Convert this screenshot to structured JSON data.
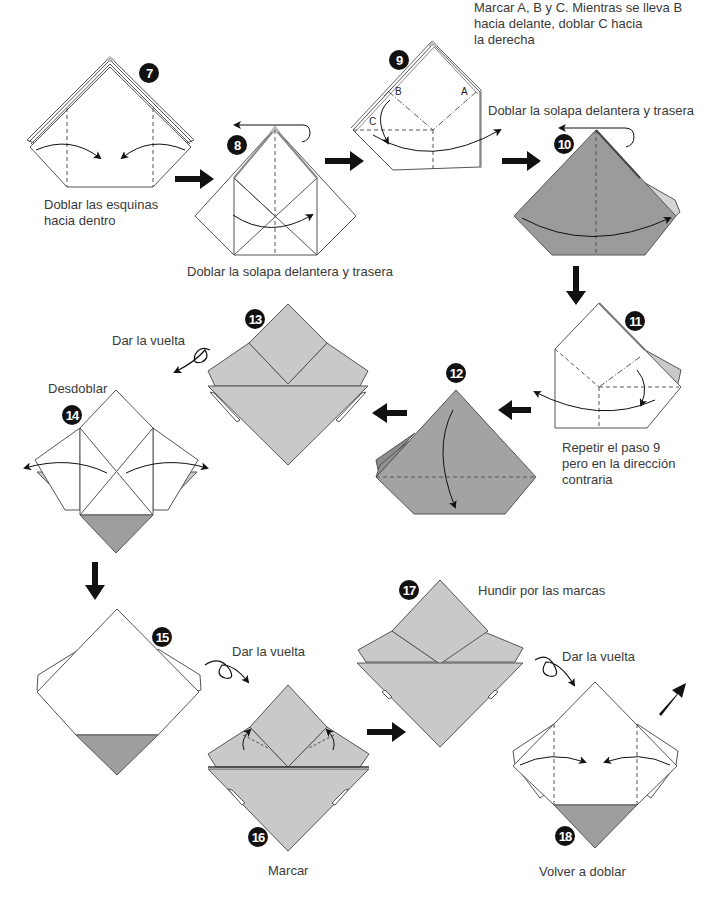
{
  "colors": {
    "paper_white": "#ffffff",
    "paper_light_gray": "#c9c9c9",
    "paper_mid_gray": "#a6a6a6",
    "paper_dark_gray": "#9a9a9a",
    "line": "#555555",
    "arrow": "#111111"
  },
  "steps": [
    {
      "number": "7",
      "caption": "Doblar las esquinas\nhacia dentro",
      "caption_lines": [
        "Doblar las esquinas",
        "hacia dentro"
      ]
    },
    {
      "number": "8",
      "caption": "Doblar la solapa delantera y trasera"
    },
    {
      "number": "9",
      "caption_lines": [
        "Marcar A, B y C. Mientras se lleva B",
        "hacia delante, doblar C hacia",
        "la derecha"
      ],
      "points": [
        "A",
        "B",
        "C"
      ]
    },
    {
      "number": "10",
      "caption": "Doblar la solapa delantera y trasera"
    },
    {
      "number": "11",
      "caption_lines": [
        "Repetir el paso 9",
        "pero en la dirección",
        "contraria"
      ]
    },
    {
      "number": "12",
      "caption": ""
    },
    {
      "number": "13",
      "caption": "Dar la vuelta"
    },
    {
      "number": "14",
      "caption": "Desdoblar"
    },
    {
      "number": "15",
      "caption": "Dar la vuelta"
    },
    {
      "number": "16",
      "caption": "Marcar"
    },
    {
      "number": "17",
      "caption": "Hundir por las marcas"
    },
    {
      "number": "18",
      "caption": "Volver a doblar",
      "pre_caption": "Dar la vuelta"
    }
  ]
}
